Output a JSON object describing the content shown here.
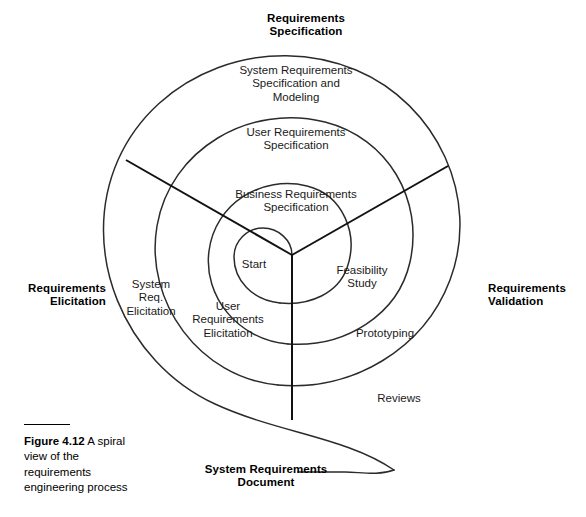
{
  "figure": {
    "number": "Figure 4.12",
    "caption": "A spiral view of the requirements engineering process"
  },
  "diagram": {
    "type": "spiral-process",
    "center_label": "Start",
    "quadrant_headings": [
      {
        "id": "requirements-specification",
        "label": "Requirements\nSpecification",
        "position": "top"
      },
      {
        "id": "requirements-validation",
        "label": "Requirements\nValidation",
        "position": "right"
      },
      {
        "id": "system-requirements-document",
        "label": "System Requirements\nDocument",
        "position": "bottom"
      },
      {
        "id": "requirements-elicitation",
        "label": "Requirements\nElicitation",
        "position": "left"
      }
    ],
    "ring_labels": [
      {
        "id": "system-requirements-specification-and-modeling",
        "label": "System Requirements\nSpecification and\nModeling",
        "ring": "outer",
        "sector": "specification"
      },
      {
        "id": "user-requirements-specification",
        "label": "User Requirements\nSpecification",
        "ring": "middle",
        "sector": "specification"
      },
      {
        "id": "business-requirements-specification",
        "label": "Business Requirements\nSpecification",
        "ring": "inner",
        "sector": "specification"
      },
      {
        "id": "feasibility-study",
        "label": "Feasibility\nStudy",
        "ring": "inner",
        "sector": "validation"
      },
      {
        "id": "prototyping",
        "label": "Prototyping",
        "ring": "middle",
        "sector": "validation"
      },
      {
        "id": "reviews",
        "label": "Reviews",
        "ring": "outer",
        "sector": "validation"
      },
      {
        "id": "user-requirements-elicitation",
        "label": "User\nRequirements\nElicitation",
        "ring": "inner",
        "sector": "elicitation"
      },
      {
        "id": "system-req-elicitation",
        "label": "System\nReq.\nElicitation",
        "ring": "middle",
        "sector": "elicitation"
      }
    ],
    "colors": {
      "stroke": "#2b2b2b",
      "radial_stroke": "#111111",
      "text": "#1a1a1a",
      "background": "#ffffff"
    }
  }
}
